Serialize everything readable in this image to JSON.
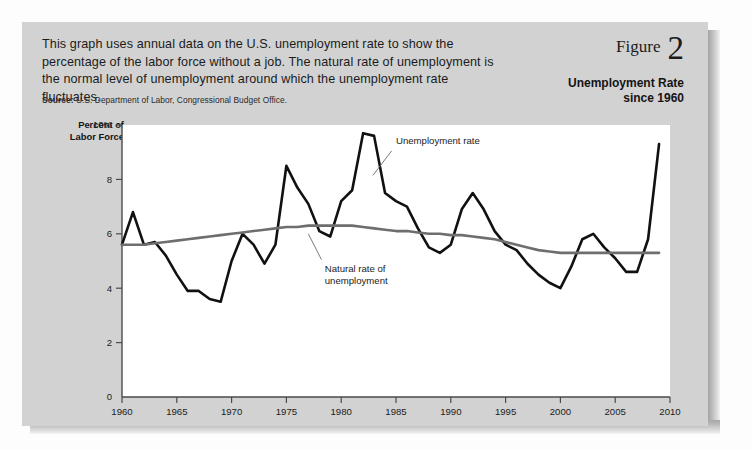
{
  "figure": {
    "label": "Figure",
    "number": "2",
    "title_line1": "Unemployment Rate",
    "title_line2": "since 1960"
  },
  "caption": "This graph uses annual data on the U.S. unemployment rate to show the percentage of the labor force without a job. The natural rate of unemployment is the normal level of unemployment around which the unemployment rate fluctuates.",
  "source_label": "Source:",
  "source_text": "U.S. Department of Labor, Congressional Budget Office.",
  "colors": {
    "card_background": "#d2d2d2",
    "plot_background": "#ffffff",
    "unemployment_line": "#111111",
    "natural_rate_line": "#6e6e6e",
    "text": "#1b1b1b"
  },
  "chart_data": {
    "type": "line",
    "title": "Unemployment Rate since 1960",
    "xlabel": "",
    "ylabel": "Percent of Labor Force",
    "ylabel_line1": "Percent of",
    "ylabel_line2": "Labor Force",
    "xlim": [
      1960,
      2010
    ],
    "ylim": [
      0,
      10
    ],
    "grid": false,
    "legend_position": "inline-annotation",
    "y_ticks": [
      0,
      2,
      4,
      6,
      8,
      10
    ],
    "y_tick_labels": [
      "0",
      "2",
      "4",
      "6",
      "8",
      "10%"
    ],
    "x_ticks": [
      1960,
      1965,
      1970,
      1975,
      1980,
      1985,
      1990,
      1995,
      2000,
      2005,
      2010
    ],
    "x_tick_labels": [
      "1960",
      "1965",
      "1970",
      "1975",
      "1980",
      "1985",
      "1990",
      "1995",
      "2000",
      "2005",
      "2010"
    ],
    "x": [
      1960,
      1961,
      1962,
      1963,
      1964,
      1965,
      1966,
      1967,
      1968,
      1969,
      1970,
      1971,
      1972,
      1973,
      1974,
      1975,
      1976,
      1977,
      1978,
      1979,
      1980,
      1981,
      1982,
      1983,
      1984,
      1985,
      1986,
      1987,
      1988,
      1989,
      1990,
      1991,
      1992,
      1993,
      1994,
      1995,
      1996,
      1997,
      1998,
      1999,
      2000,
      2001,
      2002,
      2003,
      2004,
      2005,
      2006,
      2007,
      2008,
      2009
    ],
    "series": [
      {
        "name": "Unemployment rate",
        "annotation": "Unemployment rate",
        "color": "#111111",
        "values": [
          5.6,
          6.8,
          5.6,
          5.7,
          5.2,
          4.5,
          3.9,
          3.9,
          3.6,
          3.5,
          5.0,
          6.0,
          5.6,
          4.9,
          5.6,
          8.5,
          7.7,
          7.1,
          6.1,
          5.9,
          7.2,
          7.6,
          9.7,
          9.6,
          7.5,
          7.2,
          7.0,
          6.2,
          5.5,
          5.3,
          5.6,
          6.9,
          7.5,
          6.9,
          6.1,
          5.6,
          5.4,
          4.9,
          4.5,
          4.2,
          4.0,
          4.8,
          5.8,
          6.0,
          5.5,
          5.1,
          4.6,
          4.6,
          5.8,
          9.3
        ]
      },
      {
        "name": "Natural rate of unemployment",
        "annotation": "Natural rate of unemployment",
        "color": "#6e6e6e",
        "values": [
          5.6,
          5.6,
          5.6,
          5.65,
          5.7,
          5.75,
          5.8,
          5.85,
          5.9,
          5.95,
          6.0,
          6.05,
          6.1,
          6.15,
          6.2,
          6.25,
          6.25,
          6.3,
          6.3,
          6.3,
          6.3,
          6.3,
          6.25,
          6.2,
          6.15,
          6.1,
          6.1,
          6.05,
          6.0,
          6.0,
          5.95,
          5.95,
          5.9,
          5.85,
          5.8,
          5.7,
          5.6,
          5.5,
          5.4,
          5.35,
          5.3,
          5.3,
          5.3,
          5.3,
          5.3,
          5.3,
          5.3,
          5.3,
          5.3,
          5.3
        ]
      }
    ],
    "annotations": [
      {
        "text": "Unemployment rate",
        "x": 1985,
        "y": 9.3
      },
      {
        "text": "Natural rate of unemployment",
        "x": 1978.5,
        "y": 4.6
      }
    ]
  }
}
